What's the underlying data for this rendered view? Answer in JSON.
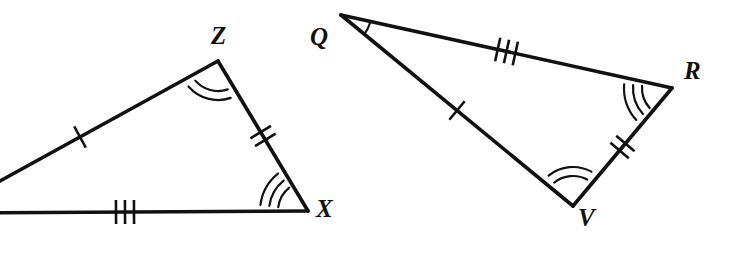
{
  "figure": {
    "kind": "geometry-diagram",
    "stroke_color": "#111111",
    "background_color": "#ffffff",
    "width": 730,
    "height": 253,
    "triangles": [
      {
        "id": "triangle-zx",
        "name": "left-triangle",
        "note": "left vertex is cropped beyond the left edge of the image",
        "vertices": [
          {
            "id": "vertex-left-offscreen",
            "label": "",
            "x": -58,
            "y": 213,
            "label_x": 0,
            "label_y": 0,
            "visible_label": false,
            "arcs": 1
          },
          {
            "id": "vertex-z",
            "label": "Z",
            "x": 218,
            "y": 61,
            "label_x": 211,
            "label_y": 23,
            "visible_label": true,
            "arcs": 2
          },
          {
            "id": "vertex-x",
            "label": "X",
            "x": 308,
            "y": 211,
            "label_x": 316,
            "label_y": 196,
            "visible_label": true,
            "arcs": 3
          }
        ],
        "sides": [
          {
            "id": "side-left-to-z",
            "from": "vertex-left-offscreen",
            "to": "vertex-z",
            "ticks": 1
          },
          {
            "id": "side-z-to-x",
            "from": "vertex-z",
            "to": "vertex-x",
            "ticks": 2
          },
          {
            "id": "side-x-to-left",
            "from": "vertex-x",
            "to": "vertex-left-offscreen",
            "ticks": 3
          }
        ]
      },
      {
        "id": "triangle-qrv",
        "name": "right-triangle",
        "note": "fully visible",
        "vertices": [
          {
            "id": "vertex-q",
            "label": "Q",
            "x": 341,
            "y": 15,
            "label_x": 310,
            "label_y": 24,
            "visible_label": true,
            "arcs": 1
          },
          {
            "id": "vertex-r",
            "label": "R",
            "x": 672,
            "y": 88,
            "label_x": 684,
            "label_y": 58,
            "visible_label": true,
            "arcs": 3
          },
          {
            "id": "vertex-v",
            "label": "V",
            "x": 573,
            "y": 206,
            "label_x": 578,
            "label_y": 205,
            "visible_label": true,
            "arcs": 2
          }
        ],
        "sides": [
          {
            "id": "side-q-to-r",
            "from": "vertex-q",
            "to": "vertex-r",
            "ticks": 3
          },
          {
            "id": "side-r-to-v",
            "from": "vertex-r",
            "to": "vertex-v",
            "ticks": 2
          },
          {
            "id": "side-v-to-q",
            "from": "vertex-v",
            "to": "vertex-q",
            "ticks": 1
          }
        ]
      }
    ],
    "labels": [
      {
        "id": "label-z",
        "text": "Z"
      },
      {
        "id": "label-x",
        "text": "X"
      },
      {
        "id": "label-q",
        "text": "Q"
      },
      {
        "id": "label-r",
        "text": "R"
      },
      {
        "id": "label-v",
        "text": "V"
      }
    ]
  }
}
